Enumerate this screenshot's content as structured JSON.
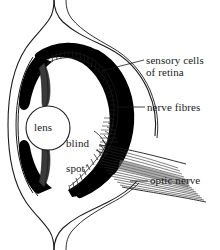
{
  "figure": {
    "background_color": "#ffffff",
    "ink_color": "#000000",
    "text_color": "#1a1a1a",
    "width": 220,
    "height": 250
  },
  "labels": {
    "sensory_cells": "sensory cells\nof retina",
    "sensory_cells_line1": "sensory cells",
    "sensory_cells_line2": "of retina",
    "nerve_fibres": "nerve fibres",
    "optic_nerve": "optic nerve",
    "lens": "lens",
    "blind_spot": "blind\nspot’",
    "blind_spot_line1": "blind",
    "blind_spot_line2": "spot’"
  },
  "top_cropped_text": "",
  "structures": {
    "sclera": "sclera-outline",
    "cornea": "cornea-outline",
    "retina": "retina-band",
    "iris_upper": "iris-upper",
    "iris_lower": "iris-lower",
    "lens_circle": "lens-circle",
    "optic_nerve_bundle": "optic-nerve-fibre-bundle",
    "blind_spot_region": "blind-spot-region"
  },
  "leader_lines": [
    {
      "name": "leader-sensory-cells",
      "from_x": 103,
      "from_y": 70,
      "to_x": 144,
      "to_y": 60
    },
    {
      "name": "leader-nerve-fibres",
      "from_x": 115,
      "from_y": 107,
      "to_x": 145,
      "to_y": 107
    },
    {
      "name": "leader-optic-nerve",
      "from_x": 131,
      "from_y": 181,
      "to_x": 148,
      "to_y": 181
    },
    {
      "name": "leader-blind-spot",
      "from_x": 96,
      "from_y": 133,
      "to_x": 108,
      "to_y": 148
    }
  ]
}
